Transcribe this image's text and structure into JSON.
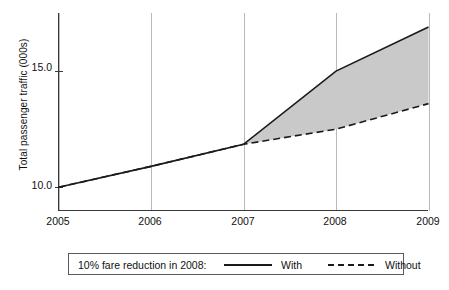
{
  "chart_data": {
    "type": "line",
    "title": "",
    "subtitle": "",
    "xlabel": "",
    "ylabel": "Total passenger traffic (000s)",
    "x": [
      2005,
      2006,
      2007,
      2008,
      2009
    ],
    "xtick_labels": [
      "2005",
      "2006",
      "2007",
      "2008",
      "2009"
    ],
    "ytick_labels": [
      "15.0",
      "10.0"
    ],
    "ytick_values": [
      15.0,
      10.0
    ],
    "xlim": [
      2005,
      2009
    ],
    "ylim": [
      9.0,
      17.5
    ],
    "grid": "vertical-only",
    "legend_position": "below-plot",
    "shaded_region": {
      "label": "difference between With and Without",
      "color": "#c9c9c9",
      "x_from": 2007,
      "x_to": 2009
    },
    "series": [
      {
        "name": "With",
        "style": "solid",
        "color": "#1a1a1a",
        "x": [
          2005,
          2006,
          2007,
          2008,
          2009
        ],
        "values": [
          10.0,
          10.9,
          11.85,
          15.0,
          16.9
        ]
      },
      {
        "name": "Without",
        "style": "dashed",
        "color": "#1a1a1a",
        "x": [
          2005,
          2006,
          2007,
          2008,
          2009
        ],
        "values": [
          10.0,
          10.9,
          11.85,
          12.5,
          13.6
        ]
      }
    ],
    "annotations": []
  },
  "legend": {
    "title": "10% fare reduction in 2008:",
    "entries": [
      {
        "label": "With",
        "style": "solid"
      },
      {
        "label": "Without",
        "style": "dashed"
      }
    ]
  },
  "axes": {
    "y_title": "Total passenger traffic (000s)",
    "y_ticks": [
      "15.0",
      "10.0"
    ],
    "x_ticks": [
      "2005",
      "2006",
      "2007",
      "2008",
      "2009"
    ]
  }
}
